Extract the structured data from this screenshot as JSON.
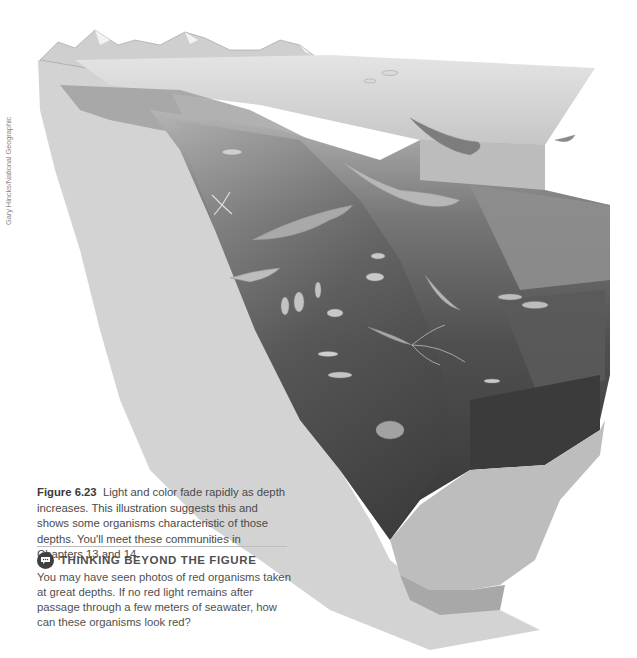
{
  "credit": "Gary Hincks/National Geographic",
  "figure": {
    "label": "Figure 6.23",
    "caption": "Light and color fade rapidly as depth increases. This illustration suggests this and shows some organisms characteristic of those depths. You'll meet these communities in Chapters 13 and 14."
  },
  "thinking_beyond": {
    "icon": "speech-bubble-icon",
    "title": "THINKING BEYOND THE FIGURE",
    "body": "You may have seen photos of red organisms taken at great depths. If no red light remains after passage through a few meters of seawater, how can these organisms look red?"
  },
  "illustration": {
    "subject": "ocean depth cross-section",
    "organisms": [
      "dolphin",
      "seal",
      "shark",
      "humpback whale",
      "octopus",
      "sea cucumber",
      "anglerfish",
      "squid",
      "lanternfish",
      "deep-sea fish",
      "sea pens",
      "eel"
    ],
    "colors": {
      "surface": "#d6d6d6",
      "shallow": "#9c9c9c",
      "mid": "#6e6e6e",
      "deep": "#4a4a4a",
      "abyss": "#353535",
      "rock": "#d0d0d0",
      "sediment": "#bfbfbf"
    }
  }
}
